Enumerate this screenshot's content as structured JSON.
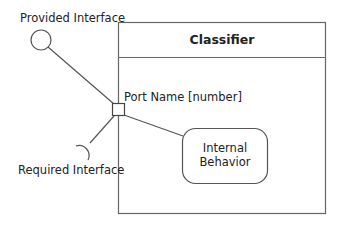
{
  "diagram": {
    "type": "UML composite structure / port diagram",
    "classifier": {
      "name": "Classifier"
    },
    "port": {
      "label": "Port Name [number]"
    },
    "provided_interface": {
      "label": "Provided Interface",
      "symbol": "lollipop-circle"
    },
    "required_interface": {
      "label": "Required Interface",
      "symbol": "socket-half-circle"
    },
    "internal_behavior": {
      "line1": "Internal",
      "line2": "Behavior"
    },
    "colors": {
      "stroke": "#555555",
      "text": "#222222",
      "background": "#ffffff"
    }
  }
}
